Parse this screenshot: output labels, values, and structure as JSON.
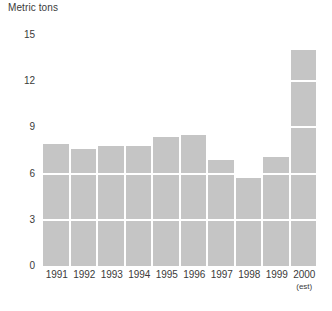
{
  "chart_data": {
    "type": "bar",
    "title": "Metric tons",
    "xlabel": "",
    "ylabel": "Metric tons",
    "categories": [
      "1991",
      "1992",
      "1993",
      "1994",
      "1995",
      "1996",
      "1997",
      "1998",
      "1999",
      "2000"
    ],
    "category_sublabels": [
      "",
      "",
      "",
      "",
      "",
      "",
      "",
      "",
      "",
      "(est)"
    ],
    "values": [
      7.9,
      7.6,
      7.8,
      7.8,
      8.4,
      8.5,
      6.9,
      5.7,
      7.1,
      14.0
    ],
    "ylim": [
      0,
      15
    ],
    "yticks": [
      0,
      3,
      6,
      9,
      12,
      15
    ],
    "ytick_labels": [
      "0",
      "3",
      "6",
      "9",
      "12",
      "15"
    ],
    "grid": true,
    "grid_color": "#ffffff",
    "legend": null,
    "bar_color": "#c5c5c5",
    "text_color": "#3a3a3a",
    "background": "#ffffff"
  }
}
